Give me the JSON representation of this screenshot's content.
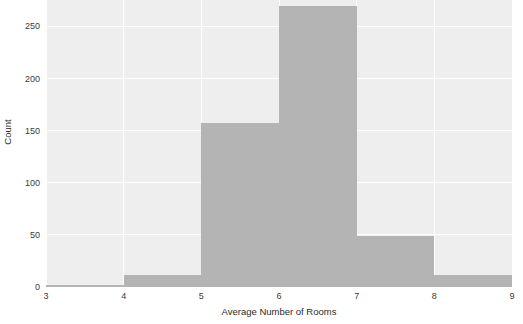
{
  "chart_data": {
    "type": "bar",
    "title": "Histogram of Average Number of Rooms",
    "subtitle": "",
    "xlabel": "Average Number of Rooms",
    "ylabel": "Count",
    "categories": [
      "3–4",
      "4–5",
      "5–6",
      "6–7",
      "7–8",
      "8–9"
    ],
    "bin_edges": [
      3,
      4,
      5,
      6,
      7,
      8,
      9
    ],
    "values": [
      2,
      12,
      157,
      270,
      49,
      12
    ],
    "xlim": [
      3,
      9
    ],
    "ylim": [
      0,
      283
    ],
    "xticks": [
      "3",
      "4",
      "5",
      "6",
      "7",
      "8",
      "9"
    ],
    "xtick_values": [
      3,
      4,
      5,
      6,
      7,
      8,
      9
    ],
    "yticks": [
      "0",
      "50",
      "100",
      "150",
      "200",
      "250"
    ],
    "ytick_values": [
      0,
      50,
      100,
      150,
      200,
      250
    ],
    "grid": true,
    "legend": false,
    "bar_color": "#b4b4b4",
    "panel_color": "#eeeeee",
    "grid_color": "#ffffff",
    "tick_label_color": "#3a3a3a",
    "axis_label_color": "#2b2b2b",
    "figure_background": "#ffffff"
  }
}
